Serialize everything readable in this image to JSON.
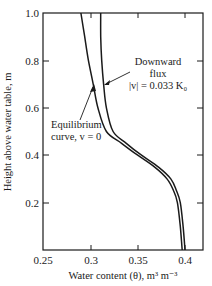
{
  "chart_data": {
    "type": "line",
    "title": "",
    "xlabel": "Water content (θ), m³ m⁻³",
    "ylabel": "Height above water table, m",
    "xlim": [
      0.25,
      0.41
    ],
    "ylim": [
      0,
      1.0
    ],
    "grid": false,
    "legend": "none (curves labelled by annotations)",
    "x_ticks": [
      {
        "value": 0.25,
        "label": "0.25"
      },
      {
        "value": 0.3,
        "label": "0.3"
      },
      {
        "value": 0.35,
        "label": "0.35"
      },
      {
        "value": 0.4,
        "label": "0.4"
      }
    ],
    "y_ticks": [
      {
        "value": 0.2,
        "label": "0.2"
      },
      {
        "value": 0.4,
        "label": "0.4"
      },
      {
        "value": 0.6,
        "label": "0.6"
      },
      {
        "value": 0.8,
        "label": "0.8"
      },
      {
        "value": 1.0,
        "label": "1.0"
      }
    ],
    "series": [
      {
        "name": "Equilibrium curve, v = 0",
        "color": "#1a1a1a",
        "points": [
          {
            "theta": 0.29,
            "h": 1.0
          },
          {
            "theta": 0.294,
            "h": 0.9
          },
          {
            "theta": 0.298,
            "h": 0.8
          },
          {
            "theta": 0.303,
            "h": 0.7
          },
          {
            "theta": 0.308,
            "h": 0.6
          },
          {
            "theta": 0.317,
            "h": 0.5
          },
          {
            "theta": 0.333,
            "h": 0.45
          },
          {
            "theta": 0.35,
            "h": 0.4
          },
          {
            "theta": 0.368,
            "h": 0.35
          },
          {
            "theta": 0.381,
            "h": 0.3
          },
          {
            "theta": 0.388,
            "h": 0.25
          },
          {
            "theta": 0.392,
            "h": 0.2
          },
          {
            "theta": 0.395,
            "h": 0.1
          },
          {
            "theta": 0.397,
            "h": 0.0
          }
        ]
      },
      {
        "name": "Downward flux |v| = 0.033 K0",
        "color": "#1a1a1a",
        "points": [
          {
            "theta": 0.311,
            "h": 1.0
          },
          {
            "theta": 0.311,
            "h": 0.9
          },
          {
            "theta": 0.312,
            "h": 0.8
          },
          {
            "theta": 0.314,
            "h": 0.7
          },
          {
            "theta": 0.317,
            "h": 0.6
          },
          {
            "theta": 0.324,
            "h": 0.5
          },
          {
            "theta": 0.338,
            "h": 0.45
          },
          {
            "theta": 0.354,
            "h": 0.4
          },
          {
            "theta": 0.372,
            "h": 0.35
          },
          {
            "theta": 0.385,
            "h": 0.3
          },
          {
            "theta": 0.391,
            "h": 0.25
          },
          {
            "theta": 0.395,
            "h": 0.2
          },
          {
            "theta": 0.398,
            "h": 0.1
          },
          {
            "theta": 0.4,
            "h": 0.0
          }
        ]
      }
    ],
    "annotations": [
      {
        "text_lines": [
          "Downward",
          "flux",
          "|v| = 0.033 K₀"
        ],
        "points_to": "Downward flux curve",
        "arrow_target": {
          "theta": 0.313,
          "h": 0.73
        }
      },
      {
        "text_lines": [
          "Equilibrium",
          "curve, v = 0"
        ],
        "points_to": "Equilibrium curve",
        "arrow_target": {
          "theta": 0.302,
          "h": 0.69
        }
      }
    ]
  },
  "labels": {
    "xlabel": "Water content (θ), m³ m⁻³",
    "ylabel": "Height above water table, m",
    "annot_flux_1": "Downward",
    "annot_flux_2": "flux",
    "annot_flux_3": "|v| = 0.033 K₀",
    "annot_eq_1": "Equilibrium",
    "annot_eq_2": "curve, v = 0",
    "xt0": "0.25",
    "xt1": "0.3",
    "xt2": "0.35",
    "xt3": "0.4",
    "yt1": "0.2",
    "yt2": "0.4",
    "yt3": "0.6",
    "yt4": "0.8",
    "yt5": "1.0"
  }
}
